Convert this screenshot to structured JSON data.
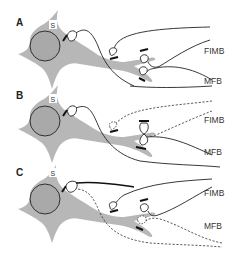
{
  "figure": {
    "type": "schematic neuron diagram",
    "panels": [
      {
        "id": "A",
        "label": "A",
        "soma_label": "S",
        "pathways": [
          "FIMB",
          "MFB"
        ],
        "description": "Intact innervation: FIMB and MFB afferents synapse on soma and dendrites"
      },
      {
        "id": "B",
        "label": "B",
        "soma_label": "S",
        "pathways": [
          "FIMB",
          "MFB"
        ],
        "description": "FIMB afferents degenerated (dashed); MFB afferent sprouts to occupy vacated sites"
      },
      {
        "id": "C",
        "label": "C",
        "soma_label": "S",
        "pathways": [
          "FIMB",
          "MFB"
        ],
        "description": "MFB afferents degenerated (dashed); FIMB afferent sprouts to soma"
      }
    ],
    "colors": {
      "neuron_fill": "#b7b7b7",
      "nucleus_fill": "#a9a9a9",
      "line": "#222222",
      "background": "#ffffff"
    }
  },
  "labels": {
    "a": "A",
    "b": "B",
    "c": "C",
    "s": "S",
    "fimb": "FIMB",
    "mfb": "MFB"
  }
}
